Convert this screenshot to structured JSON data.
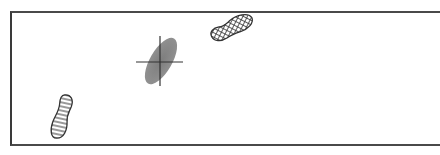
{
  "diagram": {
    "type": "footprint-trajectory",
    "colors": {
      "frame": "#444444",
      "ellipse_fill": "#8a8a8a",
      "crosshair": "#333333",
      "outline": "#333333"
    },
    "elements": [
      {
        "name": "left-footprint",
        "pattern": "horizontal-stripes",
        "position": [
          63,
          117
        ]
      },
      {
        "name": "error-ellipse",
        "pattern": "solid-gray",
        "position": [
          160,
          62
        ]
      },
      {
        "name": "crosshair",
        "position": [
          160,
          62
        ]
      },
      {
        "name": "right-footprint",
        "pattern": "crosshatch",
        "position": [
          232,
          28
        ]
      }
    ]
  }
}
